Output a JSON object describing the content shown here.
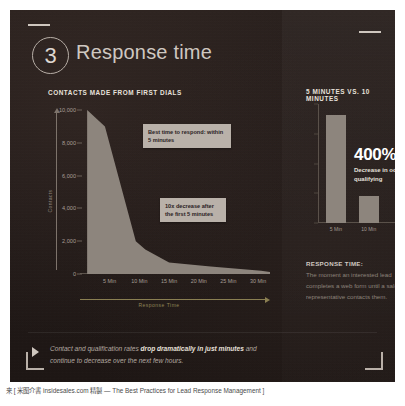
{
  "slide": {
    "number": "3",
    "title": "Response time",
    "left_section_label": "CONTACTS MADE FROM FIRST DIALS",
    "right_section_label": "5 MINUTES VS. 10 MINUTES"
  },
  "callouts": {
    "best_time": "Best time to respond: within 5 minutes",
    "decrease": "10x decrease after the first 5 minutes"
  },
  "big_stat": {
    "value": "400%",
    "description": "Decrease in odds of qualifying"
  },
  "definition": {
    "heading": "RESPONSE TIME:",
    "body": "The moment an interested lead completes a web form until a sales representative contacts them."
  },
  "note": {
    "lead": "Contact and qualification rates ",
    "bold": "drop dramatically in just minutes",
    "tail": " and continue to decrease over the next few hours."
  },
  "footer": {
    "text": "来 [ 米图介書 insidesales.com 精製 — The Best Practices for Lead Response Management ]"
  },
  "colors": {
    "slide_bg": "#241c1a",
    "area_fill": "#8d857d",
    "callout_bg": "#b9b1a9",
    "title_text": "#cfc8c1",
    "accent_axis": "#8a7f52"
  },
  "chart_data": [
    {
      "type": "area",
      "title": "CONTACTS MADE FROM FIRST DIALS",
      "xlabel": "Response Time",
      "ylabel": "Contacts",
      "ylim": [
        0,
        10000
      ],
      "yticks": [
        "0",
        "2,000",
        "4,000",
        "6,000",
        "8,000",
        "10,000"
      ],
      "ytick_values": [
        0,
        2000,
        4000,
        6000,
        8000,
        10000
      ],
      "xticks": [
        "5 Min",
        "10 Min",
        "15 Min",
        "20 Min",
        "25 Min",
        "30 Min"
      ],
      "xtick_values": [
        5,
        10,
        15,
        20,
        25,
        30
      ],
      "xlim": [
        0,
        32
      ],
      "grid": false,
      "points": [
        {
          "x": 1.2,
          "y": 10000
        },
        {
          "x": 4.2,
          "y": 9000
        },
        {
          "x": 9.4,
          "y": 2000
        },
        {
          "x": 11.0,
          "y": 1500
        },
        {
          "x": 15.0,
          "y": 700
        },
        {
          "x": 22.0,
          "y": 450
        },
        {
          "x": 30.5,
          "y": 200
        },
        {
          "x": 32.0,
          "y": 120
        }
      ],
      "annotations": [
        "Best time to respond: within 5 minutes",
        "10x decrease after the first 5 minutes"
      ]
    },
    {
      "type": "bar",
      "title": "5 MINUTES VS. 10 MINUTES",
      "categories": [
        "5 Min",
        "10 Min"
      ],
      "values": [
        100,
        25
      ],
      "ylim": [
        0,
        110
      ],
      "yticks": [
        "",
        "",
        "",
        "",
        ""
      ],
      "xlabel": "",
      "ylabel": "",
      "grid": false,
      "annotation": "400% Decrease in odds of qualifying"
    }
  ]
}
